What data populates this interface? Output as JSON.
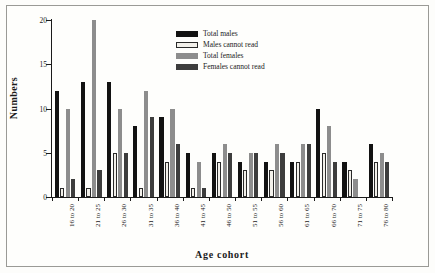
{
  "chart_data": {
    "type": "bar",
    "title": "",
    "xlabel": "Age cohort",
    "ylabel": "Numbers",
    "ylim": [
      0,
      20
    ],
    "yticks": [
      0,
      5,
      10,
      15,
      20
    ],
    "grid": false,
    "legend_position": "upper-center",
    "categories": [
      "16 to 20",
      "21 to 25",
      "26 to 30",
      "31 to 35",
      "36 to 40",
      "41 to 45",
      "46 to 50",
      "51 to 55",
      "56 to 60",
      "61 to 65",
      "66 to 70",
      "71 to 75",
      "76 to 80"
    ],
    "series": [
      {
        "name": "Total males",
        "color": "#121212",
        "values": [
          12,
          13,
          13,
          8,
          9,
          5,
          5,
          4,
          4,
          4,
          10,
          4,
          6
        ]
      },
      {
        "name": "Males cannot read",
        "color": "#f2f0ea",
        "values": [
          1,
          1,
          5,
          1,
          4,
          1,
          4,
          3,
          3,
          4,
          5,
          3,
          4
        ]
      },
      {
        "name": "Total females",
        "color": "#8d8d8d",
        "values": [
          10,
          20,
          10,
          12,
          10,
          4,
          6,
          5,
          6,
          6,
          8,
          2,
          5
        ]
      },
      {
        "name": "Females cannot read",
        "color": "#3d3d3d",
        "values": [
          2,
          3,
          5,
          9,
          6,
          1,
          5,
          5,
          5,
          6,
          4,
          0,
          4
        ]
      }
    ]
  },
  "axis": {
    "y_title": "Numbers",
    "x_title": "Age cohort"
  }
}
